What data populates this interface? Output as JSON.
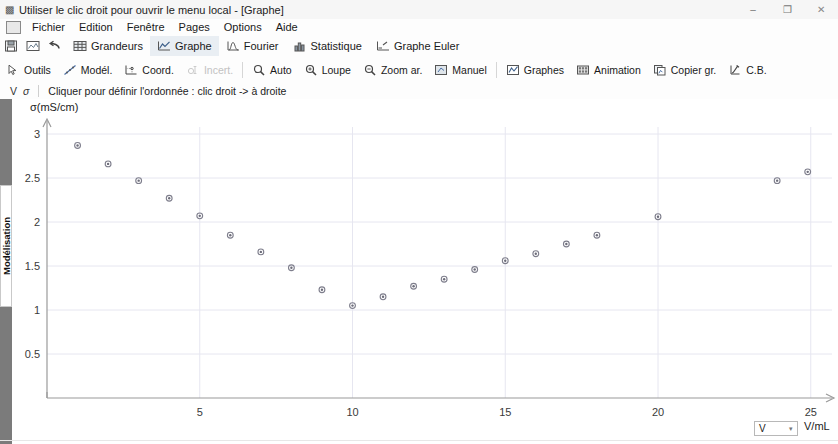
{
  "window": {
    "title": "Utiliser le clic droit pour ouvrir le menu local - [Graphe]",
    "title_icon": "app-window-icon",
    "minimize": "–",
    "maximize": "❐",
    "close": "✕",
    "sub_minimize": "–",
    "sub_restore": "❐",
    "sub_close": "✕"
  },
  "menu": {
    "icon": "document-icon",
    "items": [
      {
        "label": "Fichier"
      },
      {
        "label": "Edition"
      },
      {
        "label": "Fenêtre"
      },
      {
        "label": "Pages"
      },
      {
        "label": "Options"
      },
      {
        "label": "Aide"
      }
    ]
  },
  "tabs": {
    "icon_buttons": [
      {
        "name": "save-icon"
      },
      {
        "name": "print-preview-icon"
      },
      {
        "name": "undo-arrow-icon"
      }
    ],
    "items": [
      {
        "label": "Grandeurs",
        "icon": "table-icon",
        "active": false
      },
      {
        "label": "Graphe",
        "icon": "graph-curve-icon",
        "active": true
      },
      {
        "label": "Fourier",
        "icon": "fourier-peak-icon",
        "active": false
      },
      {
        "label": "Statistique",
        "icon": "histogram-icon",
        "active": false
      },
      {
        "label": "Graphe Euler",
        "icon": "euler-graph-icon",
        "active": false
      }
    ]
  },
  "toolbar": {
    "items": [
      {
        "label": "Outils",
        "icon": "cursor-arrow-icon",
        "disabled": false
      },
      {
        "label": "Modél.",
        "icon": "model-curve-icon",
        "disabled": false
      },
      {
        "label": "Coord.",
        "icon": "coordinates-icon",
        "disabled": false
      },
      {
        "label": "Incert.",
        "icon": "uncertainty-icon",
        "disabled": true
      },
      {
        "label": "Auto",
        "icon": "magnifier-auto-icon",
        "disabled": false
      },
      {
        "label": "Loupe",
        "icon": "magnifier-icon",
        "disabled": false
      },
      {
        "label": "Zoom ar.",
        "icon": "magnifier-minus-icon",
        "disabled": false
      },
      {
        "label": "Manuel",
        "icon": "manual-zoom-icon",
        "disabled": false
      },
      {
        "label": "Graphes",
        "icon": "graphs-window-icon",
        "disabled": false
      },
      {
        "label": "Animation",
        "icon": "film-strip-icon",
        "disabled": false
      },
      {
        "label": "Copier gr.",
        "icon": "copy-graph-icon",
        "disabled": false
      },
      {
        "label": "C.B.",
        "icon": "clipboard-icon",
        "disabled": false
      }
    ]
  },
  "hintbar": {
    "axis_v": "V",
    "axis_sigma": "σ",
    "message": "Cliquer pour définir l'ordonnée : clic droit -> à droite"
  },
  "sidebar": {
    "vertical_tab": "Modélisation"
  },
  "x_selector": {
    "value": "V",
    "caret": "▾",
    "unit": "V/mL"
  },
  "chart_data": {
    "type": "scatter",
    "title": "",
    "xlabel": "V/mL",
    "ylabel": "σ(mS/cm)",
    "xlim": [
      0,
      25.8
    ],
    "ylim": [
      0,
      3.25
    ],
    "xticks": [
      5,
      10,
      15,
      20,
      25
    ],
    "yticks": [
      0.5,
      1,
      1.5,
      2,
      2.5,
      3
    ],
    "grid": true,
    "legend": "none",
    "marker": "open-circle-gray",
    "series": [
      {
        "name": "σ(mS/cm)",
        "points": [
          {
            "x": 1.0,
            "y": 2.87
          },
          {
            "x": 2.0,
            "y": 2.66
          },
          {
            "x": 3.0,
            "y": 2.47
          },
          {
            "x": 4.0,
            "y": 2.27
          },
          {
            "x": 5.0,
            "y": 2.07
          },
          {
            "x": 6.0,
            "y": 1.85
          },
          {
            "x": 7.0,
            "y": 1.66
          },
          {
            "x": 8.0,
            "y": 1.48
          },
          {
            "x": 9.0,
            "y": 1.23
          },
          {
            "x": 10.0,
            "y": 1.05
          },
          {
            "x": 11.0,
            "y": 1.15
          },
          {
            "x": 12.0,
            "y": 1.27
          },
          {
            "x": 13.0,
            "y": 1.35
          },
          {
            "x": 14.0,
            "y": 1.46
          },
          {
            "x": 15.0,
            "y": 1.56
          },
          {
            "x": 16.0,
            "y": 1.64
          },
          {
            "x": 17.0,
            "y": 1.75
          },
          {
            "x": 18.0,
            "y": 1.85
          },
          {
            "x": 20.0,
            "y": 2.06
          },
          {
            "x": 23.9,
            "y": 2.47
          },
          {
            "x": 24.9,
            "y": 2.57
          }
        ]
      }
    ]
  }
}
